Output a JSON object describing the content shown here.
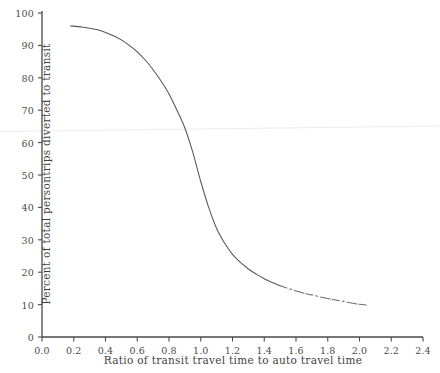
{
  "chart_data": {
    "type": "line",
    "title": "",
    "xlabel": "Ratio of transit travel time to auto travel time",
    "ylabel": "Percent of total persontrips diverted to transit",
    "xlim": [
      0.0,
      2.4
    ],
    "ylim": [
      0,
      100
    ],
    "grid": false,
    "legend": "none",
    "xticks": [
      "0.0",
      "0.2",
      "0.4",
      "0.6",
      "0.8",
      "1.0",
      "1.2",
      "1.4",
      "1.6",
      "1.8",
      "2.0",
      "2.2",
      "2.4"
    ],
    "yticks": [
      "0",
      "10",
      "20",
      "30",
      "40",
      "50",
      "60",
      "70",
      "80",
      "90",
      "100"
    ],
    "line_color": "#555555",
    "axis_color": "#4a4a4a",
    "background_color": "#ffffff",
    "series": [
      {
        "name": "Transit diversion curve",
        "style": "solid-fading-to-dashed",
        "x": [
          0.18,
          0.25,
          0.3,
          0.35,
          0.4,
          0.45,
          0.5,
          0.55,
          0.6,
          0.65,
          0.7,
          0.75,
          0.8,
          0.85,
          0.9,
          0.95,
          1.0,
          1.05,
          1.1,
          1.15,
          1.2,
          1.25,
          1.3,
          1.35,
          1.4,
          1.45,
          1.5,
          1.55,
          1.6,
          1.65,
          1.7,
          1.75,
          1.8,
          1.85,
          1.9,
          1.95,
          2.0,
          2.05
        ],
        "y": [
          96.0,
          95.7,
          95.3,
          94.8,
          94.0,
          93.0,
          91.7,
          90.0,
          88.0,
          85.5,
          82.5,
          79.0,
          75.0,
          70.0,
          64.5,
          57.0,
          48.0,
          40.0,
          33.5,
          29.0,
          25.5,
          23.0,
          21.0,
          19.4,
          18.0,
          16.8,
          15.8,
          15.0,
          14.2,
          13.5,
          13.0,
          12.4,
          11.9,
          11.4,
          11.0,
          10.5,
          10.1,
          9.8
        ]
      }
    ],
    "annotations": []
  },
  "axes": {
    "x_title": "Ratio of transit travel time to auto travel time",
    "y_title": "Percent of total persontrips diverted to transit"
  }
}
